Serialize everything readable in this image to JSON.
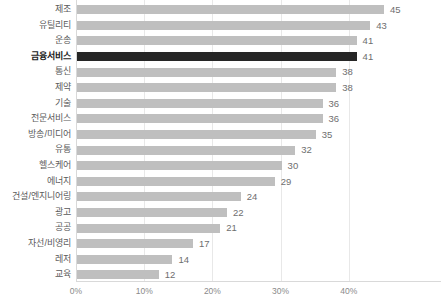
{
  "chart_data": {
    "type": "bar",
    "orientation": "horizontal",
    "title": "",
    "subtitle": "",
    "xlabel": "",
    "ylabel": "",
    "xlim": [
      0,
      50
    ],
    "grid": true,
    "legend": false,
    "value_suffix": "",
    "axis_tick_suffix": "%",
    "xticks": [
      "0%",
      "10%",
      "20%",
      "30%",
      "40%"
    ],
    "xtick_values": [
      0,
      10,
      20,
      30,
      40
    ],
    "highlight_category": "금융서비스",
    "colors": {
      "bar": "#BFBFBF",
      "bar_highlight": "#262626",
      "label": "#5A5A5A",
      "label_highlight": "#1A1A1A",
      "value": "#6E6E6E",
      "gridline": "#E8E8E8",
      "axis": "#D9D9D9",
      "background": "#FFFFFF"
    },
    "categories": [
      "제조",
      "유틸리티",
      "운송",
      "금융서비스",
      "통신",
      "제약",
      "기술",
      "전문서비스",
      "방송/미디어",
      "유통",
      "헬스케어",
      "에너지",
      "건설/엔지니어링",
      "광고",
      "공공",
      "자선/비영리",
      "레저",
      "교육"
    ],
    "values": [
      45,
      43,
      41,
      41,
      38,
      38,
      36,
      36,
      35,
      32,
      30,
      29,
      24,
      22,
      21,
      17,
      14,
      12
    ],
    "value_labels": [
      "45",
      "43",
      "41",
      "41",
      "38",
      "38",
      "36",
      "36",
      "35",
      "32",
      "30",
      "29",
      "24",
      "22",
      "21",
      "17",
      "14",
      "12"
    ]
  }
}
